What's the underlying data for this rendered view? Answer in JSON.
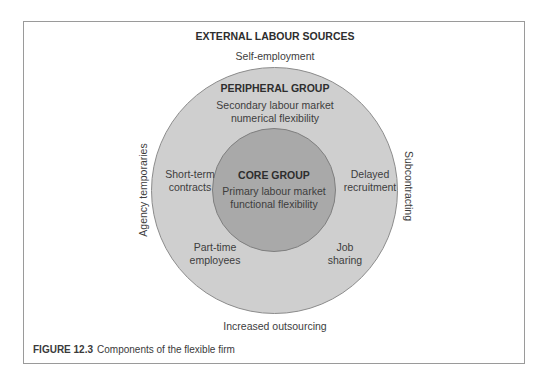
{
  "figure": {
    "title": "EXTERNAL LABOUR SOURCES",
    "caption_number": "FIGURE 12.3",
    "caption_text": "Components of the flexible firm"
  },
  "external": {
    "top": "Self-employment",
    "bottom": "Increased outsourcing",
    "left": "Agency temporaries",
    "right": "Subcontracting"
  },
  "peripheral": {
    "title": "PERIPHERAL GROUP",
    "subtitle": "Secondary labour market\nnumerical flexibility",
    "items": [
      {
        "label": "Short-term\ncontracts",
        "position": "left"
      },
      {
        "label": "Delayed\nrecruitment",
        "position": "right"
      },
      {
        "label": "Part-time\nemployees",
        "position": "bottom-left"
      },
      {
        "label": "Job\nsharing",
        "position": "bottom-right"
      }
    ]
  },
  "core": {
    "title": "CORE GROUP",
    "subtitle": "Primary labour market\nfunctional flexibility"
  },
  "colors": {
    "outer_circle": "#cfcfcf",
    "inner_circle": "#a9a9a9",
    "circle_stroke": "#8c8c8c",
    "frame": "#9a9a9a",
    "text": "#3d3d3d"
  }
}
